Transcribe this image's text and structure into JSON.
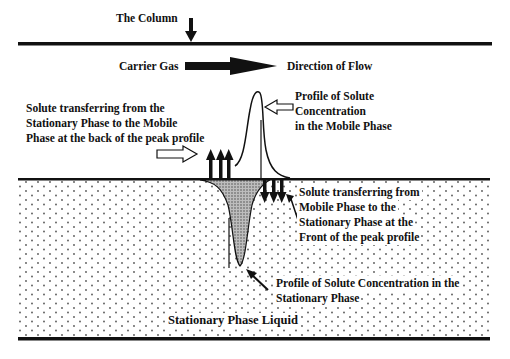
{
  "diagram": {
    "labels": {
      "column": "The Column",
      "carrier_gas": "Carrier Gas",
      "direction_of_flow": "Direction of Flow",
      "mobile_profile": [
        "Profile of Solute",
        "Concentration",
        "in the Mobile Phase"
      ],
      "back_transfer": [
        "Solute transferring from the",
        "Stationary Phase to the Mobile",
        "Phase at the back of the peak profile"
      ],
      "front_transfer": [
        "Solute transferring from",
        "Mobile Phase to the",
        "Stationary Phase at the",
        "Front of the peak profile"
      ],
      "stationary_profile": [
        "Profile of Solute Concentration in the",
        "Stationary Phase"
      ],
      "stationary_liquid": "Stationary Phase Liquid"
    },
    "colors": {
      "ink": "#111111",
      "background": "#ffffff",
      "stipple": "#555555",
      "hatch_fill": "#9a9a9a"
    }
  }
}
